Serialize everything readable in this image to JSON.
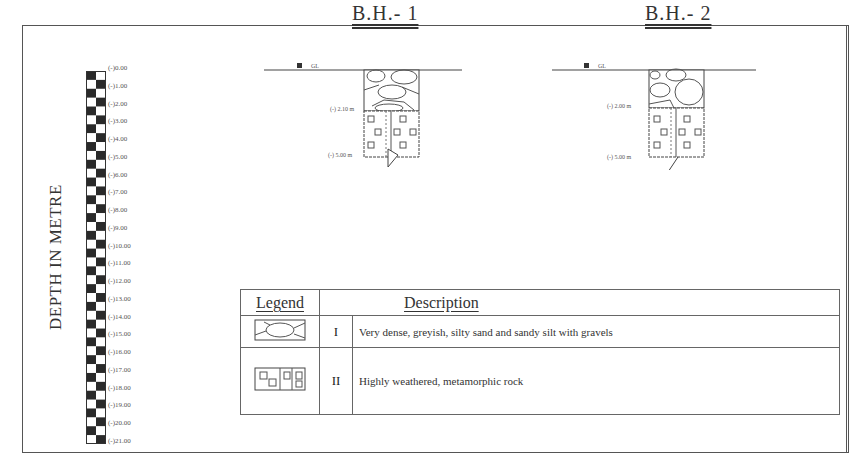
{
  "figure": {
    "y_axis_label": "DEPTH IN METRE",
    "scale_ticks": [
      "(-)0.00",
      "(-)1.00",
      "(-)2.00",
      "(-)3.00",
      "(-)4.00",
      "(-)5.00",
      "(-)6.00",
      "(-)7.00",
      "(-)8.00",
      "(-)9.00",
      "(-)10.00",
      "(-)11.00",
      "(-)12.00",
      "(-)13.00",
      "(-)14.00",
      "(-)15.00",
      "(-)16.00",
      "(-)17.00",
      "(-)18.00",
      "(-)19.00",
      "(-)20.00",
      "(-)21.00"
    ]
  },
  "boreholes": [
    {
      "title": "B.H.- 1",
      "ground_label": "GL",
      "layer_boundary": "(-) 2.10 m",
      "bottom": "(-) 5.00 m"
    },
    {
      "title": "B.H.- 2",
      "ground_label": "GL",
      "layer_boundary": "(-) 2.00 m",
      "bottom": "(-) 5.00 m"
    }
  ],
  "legend": {
    "header_legend": "Legend",
    "header_description": "Description",
    "rows": [
      {
        "symbol": "gravel-sand-symbol",
        "number": "I",
        "description": "Very dense, greyish, silty sand and sandy silt with gravels"
      },
      {
        "symbol": "weathered-rock-symbol",
        "number": "II",
        "description": "Highly weathered, metamorphic rock"
      }
    ]
  }
}
